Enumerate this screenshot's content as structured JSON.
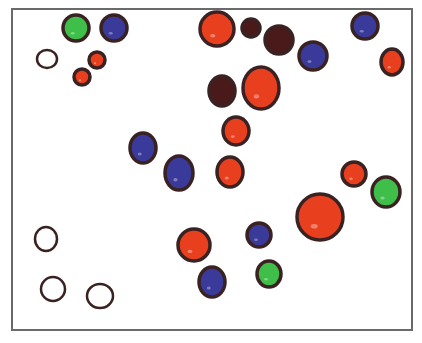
{
  "colors": {
    "outline": "#3a2222",
    "red": "#e8401f",
    "blue": "#3a3a9a",
    "green": "#3fbf4a",
    "maroon": "#4a1a1a",
    "empty": "#ffffff",
    "frame": "#6a6a6a"
  },
  "circles": [
    {
      "cx": 76,
      "cy": 28,
      "rx": 13,
      "ry": 13,
      "fill": "green"
    },
    {
      "cx": 114,
      "cy": 28,
      "rx": 13,
      "ry": 13,
      "fill": "blue"
    },
    {
      "cx": 47,
      "cy": 59,
      "rx": 10,
      "ry": 9,
      "fill": "empty"
    },
    {
      "cx": 97,
      "cy": 60,
      "rx": 8,
      "ry": 8,
      "fill": "red"
    },
    {
      "cx": 82,
      "cy": 77,
      "rx": 8,
      "ry": 8,
      "fill": "red"
    },
    {
      "cx": 217,
      "cy": 29,
      "rx": 17,
      "ry": 17,
      "fill": "red"
    },
    {
      "cx": 251,
      "cy": 28,
      "rx": 9,
      "ry": 9,
      "fill": "maroon"
    },
    {
      "cx": 279,
      "cy": 40,
      "rx": 14,
      "ry": 14,
      "fill": "maroon"
    },
    {
      "cx": 313,
      "cy": 56,
      "rx": 14,
      "ry": 14,
      "fill": "blue"
    },
    {
      "cx": 365,
      "cy": 26,
      "rx": 13,
      "ry": 13,
      "fill": "blue"
    },
    {
      "cx": 392,
      "cy": 62,
      "rx": 11,
      "ry": 13,
      "fill": "red"
    },
    {
      "cx": 222,
      "cy": 91,
      "rx": 13,
      "ry": 15,
      "fill": "maroon"
    },
    {
      "cx": 261,
      "cy": 88,
      "rx": 18,
      "ry": 21,
      "fill": "red"
    },
    {
      "cx": 236,
      "cy": 131,
      "rx": 13,
      "ry": 14,
      "fill": "red"
    },
    {
      "cx": 143,
      "cy": 148,
      "rx": 13,
      "ry": 15,
      "fill": "blue"
    },
    {
      "cx": 179,
      "cy": 173,
      "rx": 14,
      "ry": 17,
      "fill": "blue"
    },
    {
      "cx": 230,
      "cy": 172,
      "rx": 13,
      "ry": 15,
      "fill": "red"
    },
    {
      "cx": 354,
      "cy": 174,
      "rx": 12,
      "ry": 12,
      "fill": "red"
    },
    {
      "cx": 386,
      "cy": 192,
      "rx": 14,
      "ry": 15,
      "fill": "green"
    },
    {
      "cx": 320,
      "cy": 217,
      "rx": 23,
      "ry": 23,
      "fill": "red"
    },
    {
      "cx": 46,
      "cy": 239,
      "rx": 11,
      "ry": 12,
      "fill": "empty"
    },
    {
      "cx": 194,
      "cy": 245,
      "rx": 16,
      "ry": 16,
      "fill": "red"
    },
    {
      "cx": 259,
      "cy": 235,
      "rx": 12,
      "ry": 12,
      "fill": "blue"
    },
    {
      "cx": 53,
      "cy": 289,
      "rx": 12,
      "ry": 12,
      "fill": "empty"
    },
    {
      "cx": 100,
      "cy": 296,
      "rx": 13,
      "ry": 12,
      "fill": "empty"
    },
    {
      "cx": 212,
      "cy": 282,
      "rx": 13,
      "ry": 15,
      "fill": "blue"
    },
    {
      "cx": 269,
      "cy": 274,
      "rx": 12,
      "ry": 13,
      "fill": "green"
    }
  ]
}
